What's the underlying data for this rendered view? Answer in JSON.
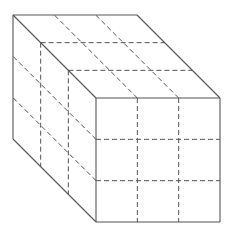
{
  "diagram": {
    "title": "",
    "type": "cube-3x3x3-oblique",
    "grid_divisions": 3,
    "colors": {
      "stroke": "#555555",
      "background": "#ffffff"
    },
    "front_face": {
      "x": 96,
      "y": 98,
      "size": 124
    },
    "depth_offset": {
      "dx": -83,
      "dy": -83
    }
  }
}
